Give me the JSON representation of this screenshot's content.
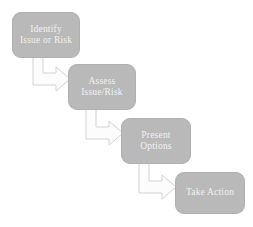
{
  "diagram": {
    "type": "flowchart",
    "orientation": "cascading-diagonal",
    "background_color": "#ffffff",
    "node_fill_color": "#b9b9b9",
    "node_border_color": "#b0b0b0",
    "node_text_color": "#f2f2f2",
    "arrow_fill_color": "#fcfcfc",
    "arrow_border_color": "#d2d2d2",
    "nodes": [
      {
        "id": "identify",
        "name": "identify-issue-or-risk",
        "lines": [
          "Identify",
          "Issue or Risk"
        ],
        "step": 1
      },
      {
        "id": "assess",
        "name": "assess-issue-risk",
        "lines": [
          "Assess",
          "Issue/Risk"
        ],
        "step": 2
      },
      {
        "id": "present",
        "name": "present-options",
        "lines": [
          "Present",
          "Options"
        ],
        "step": 3
      },
      {
        "id": "action",
        "name": "take-action",
        "lines": [
          "Take Action"
        ],
        "step": 4
      }
    ],
    "connectors": [
      {
        "id": "identify-to-assess",
        "from": "identify",
        "to": "assess",
        "shape": "elbow-arrow",
        "direction": "down-then-right"
      },
      {
        "id": "assess-to-present",
        "from": "assess",
        "to": "present",
        "shape": "elbow-arrow",
        "direction": "down-then-right"
      },
      {
        "id": "present-to-action",
        "from": "present",
        "to": "action",
        "shape": "elbow-arrow",
        "direction": "down-then-right"
      }
    ]
  }
}
